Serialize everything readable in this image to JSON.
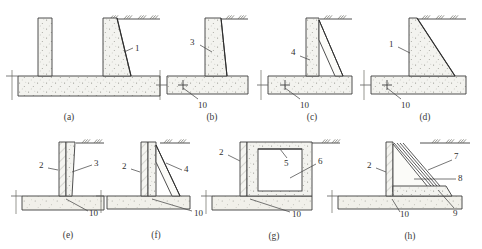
{
  "figure": {
    "panel_count": 8
  },
  "panels": [
    {
      "caption": "(a)",
      "name": "panel-a",
      "labels": [
        {
          "text": "1",
          "x": 135,
          "y": 48
        }
      ]
    },
    {
      "caption": "(b)",
      "name": "panel-b",
      "labels": [
        {
          "text": "3",
          "x": 194,
          "y": 42
        },
        {
          "text": "10",
          "x": 201,
          "y": 105
        }
      ]
    },
    {
      "caption": "(c)",
      "name": "panel-c",
      "labels": [
        {
          "text": "4",
          "x": 296,
          "y": 53
        },
        {
          "text": "10",
          "x": 303,
          "y": 105
        }
      ]
    },
    {
      "caption": "(d)",
      "name": "panel-d",
      "labels": [
        {
          "text": "1",
          "x": 400,
          "y": 46
        },
        {
          "text": "10",
          "x": 404,
          "y": 105
        }
      ]
    },
    {
      "caption": "(e)",
      "name": "panel-e",
      "labels": [
        {
          "text": "2",
          "x": 39,
          "y": 163
        },
        {
          "text": "3",
          "x": 96,
          "y": 163
        },
        {
          "text": "10",
          "x": 92,
          "y": 215
        }
      ]
    },
    {
      "caption": "(f)",
      "name": "panel-f",
      "labels": [
        {
          "text": "2",
          "x": 122,
          "y": 164
        },
        {
          "text": "4",
          "x": 185,
          "y": 166
        },
        {
          "text": "10",
          "x": 198,
          "y": 215
        }
      ]
    },
    {
      "caption": "(g)",
      "name": "panel-g",
      "labels": [
        {
          "text": "2",
          "x": 220,
          "y": 152
        },
        {
          "text": "5",
          "x": 286,
          "y": 163
        },
        {
          "text": "6",
          "x": 318,
          "y": 161
        },
        {
          "text": "10",
          "x": 297,
          "y": 215
        }
      ]
    },
    {
      "caption": "(h)",
      "name": "panel-h",
      "labels": [
        {
          "text": "2",
          "x": 368,
          "y": 163
        },
        {
          "text": "7",
          "x": 455,
          "y": 159
        },
        {
          "text": "8",
          "x": 459,
          "y": 177
        },
        {
          "text": "9",
          "x": 457,
          "y": 212
        },
        {
          "text": "10",
          "x": 404,
          "y": 216
        }
      ]
    }
  ],
  "captions_row_top": [
    "(a)",
    "(b)",
    "(c)",
    "(d)"
  ],
  "captions_row_bottom": [
    "(e)",
    "(f)",
    "(g)",
    "(h)"
  ],
  "legend_numbers": [
    "1",
    "2",
    "3",
    "4",
    "5",
    "6",
    "7",
    "8",
    "9",
    "10"
  ],
  "icons": {
    "ground_surface": "ground-hatch-icon",
    "level_marker": "level-cross-icon",
    "concrete_fill": "concrete-stipple-icon",
    "soil_fill": "soil-stipple-icon"
  },
  "colors": {
    "line": "#3c3c3c",
    "fill_concrete": "#f2f2ee",
    "fill_soil": "#f0efe9",
    "stipple": "#8d8d86",
    "text": "#2f2f2f",
    "background": "#ffffff"
  },
  "captions": {
    "a": "(a)",
    "b": "(b)",
    "c": "(c)",
    "d": "(d)",
    "e": "(e)",
    "f": "(f)",
    "g": "(g)",
    "h": "(h)"
  }
}
